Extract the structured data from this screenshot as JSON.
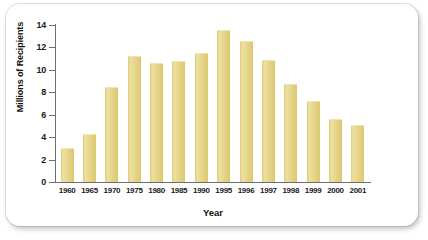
{
  "chart_data": {
    "type": "bar",
    "title": "",
    "xlabel": "Year",
    "ylabel": "Millions of Recipients",
    "categories": [
      "1960",
      "1965",
      "1970",
      "1975",
      "1980",
      "1985",
      "1990",
      "1995",
      "1996",
      "1997",
      "1998",
      "1999",
      "2000",
      "2001"
    ],
    "values": [
      3.0,
      4.25,
      8.5,
      11.2,
      10.6,
      10.8,
      11.5,
      13.6,
      12.6,
      10.9,
      8.7,
      7.2,
      5.65,
      5.05
    ],
    "ylim": [
      0,
      14
    ],
    "yticks": [
      0,
      2,
      4,
      6,
      8,
      10,
      12,
      14
    ],
    "ytick_labels": [
      "0",
      "2",
      "4",
      "6",
      "8",
      "10",
      "12",
      "14"
    ],
    "grid": false,
    "legend": null,
    "bar_color": "#e6d48a",
    "axis_color": "#6e6e6e"
  },
  "figure": {
    "background": "#ffffff",
    "card_background": "#ffffff"
  }
}
